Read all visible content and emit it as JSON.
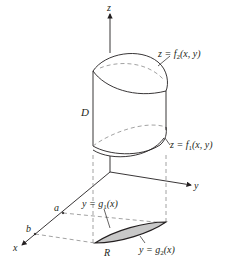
{
  "diagram": {
    "axes": {
      "z_label": "z",
      "y_label": "y",
      "x_label": "x"
    },
    "labels": {
      "top_surface": {
        "prefix": "z = f",
        "sub": "2",
        "suffix": "(x, y)"
      },
      "bottom_surface": {
        "prefix": "z = f",
        "sub": "1",
        "suffix": "(x, y)"
      },
      "solid": "D",
      "region": "R",
      "lower_curve": {
        "prefix": "y = g",
        "sub": "1",
        "suffix": "(x)"
      },
      "upper_curve": {
        "prefix": "y = g",
        "sub": "2",
        "suffix": "(x)"
      },
      "x_a": "a",
      "x_b": "b"
    },
    "colors": {
      "line": "#231f20",
      "dashed": "#8a8a8a",
      "region_fill": "#c8c8c8"
    }
  }
}
